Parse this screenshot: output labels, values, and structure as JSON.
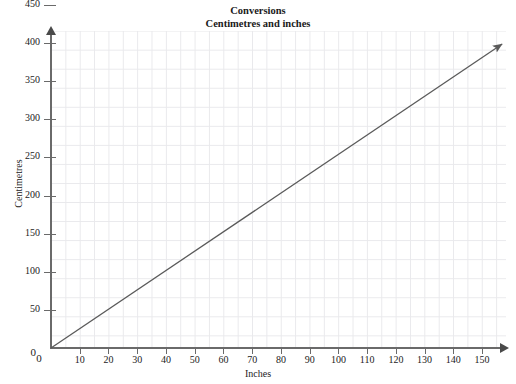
{
  "chart_data": {
    "type": "line",
    "title": "Conversions",
    "subtitle": "Centimetres and inches",
    "xlabel": "Inches",
    "ylabel": "Centimetres",
    "xlim": [
      0,
      157
    ],
    "ylim": [
      0,
      468
    ],
    "xticks": [
      0,
      10,
      20,
      30,
      40,
      50,
      60,
      70,
      80,
      90,
      100,
      110,
      120,
      130,
      140,
      150
    ],
    "yticks": [
      0,
      50,
      100,
      150,
      200,
      250,
      300,
      350,
      400,
      450
    ],
    "xtick_labels": [
      "0",
      "10",
      "20",
      "30",
      "40",
      "50",
      "60",
      "70",
      "80",
      "90",
      "100",
      "110",
      "120",
      "130",
      "140",
      "150"
    ],
    "ytick_labels": [
      "0",
      "50",
      "100",
      "150",
      "200",
      "250",
      "300",
      "350",
      "400",
      "450"
    ],
    "grid": true,
    "grid_minor_x_step": 5,
    "grid_minor_y_step": 25,
    "legend": null,
    "series": [
      {
        "name": "inches to centimetres",
        "slope_cm_per_inch": 2.54,
        "x": [
          0,
          157
        ],
        "values": [
          0,
          398.8
        ],
        "color": "#5a5a5a",
        "arrow_end": true
      }
    ],
    "axis_color": "#6a6a6a",
    "grid_color": "#e9e9ec",
    "background": "#ffffff"
  }
}
